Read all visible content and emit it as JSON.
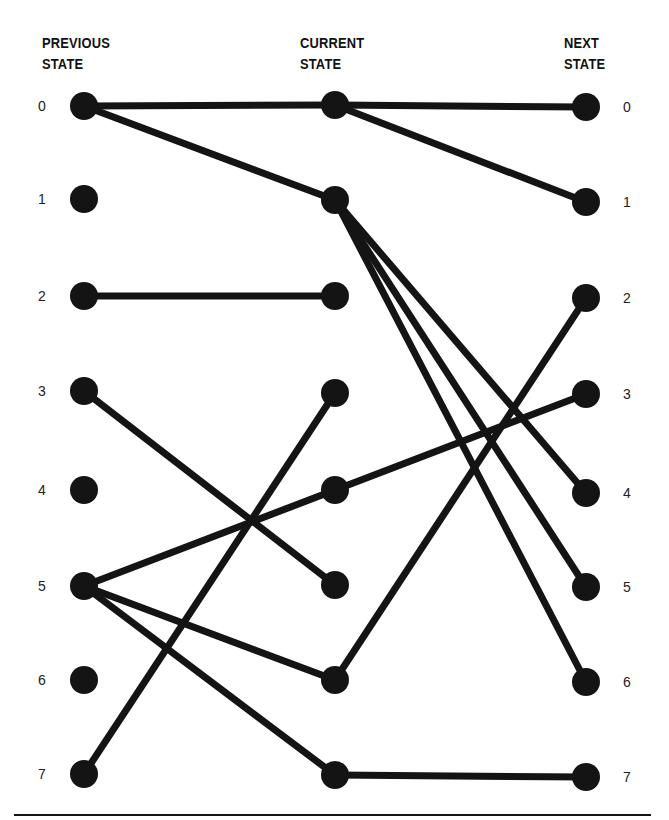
{
  "headers": {
    "previous": {
      "line1": "PREVIOUS",
      "line2": "STATE"
    },
    "current": {
      "line1": "CURRENT",
      "line2": "STATE"
    },
    "next": {
      "line1": "NEXT",
      "line2": "STATE"
    }
  },
  "states": [
    "0",
    "1",
    "2",
    "3",
    "4",
    "5",
    "6",
    "7"
  ],
  "columns": {
    "previous": {
      "x": 84,
      "ys": [
        106,
        199,
        296,
        391,
        490,
        586,
        680,
        774
      ]
    },
    "current": {
      "x": 335,
      "ys": [
        105,
        200,
        296,
        393,
        490,
        585,
        680,
        775
      ]
    },
    "next": {
      "x": 586,
      "ys": [
        107,
        202,
        298,
        394,
        493,
        587,
        682,
        777
      ]
    }
  },
  "edges": {
    "previous_to_current": [
      [
        0,
        0
      ],
      [
        0,
        1
      ],
      [
        2,
        2
      ],
      [
        3,
        5
      ],
      [
        5,
        4
      ],
      [
        5,
        6
      ],
      [
        5,
        7
      ],
      [
        7,
        3
      ]
    ],
    "current_to_next": [
      [
        0,
        0
      ],
      [
        0,
        1
      ],
      [
        1,
        4
      ],
      [
        1,
        5
      ],
      [
        1,
        6
      ],
      [
        4,
        3
      ],
      [
        6,
        2
      ],
      [
        7,
        7
      ]
    ]
  },
  "style": {
    "ink": "#141414",
    "node_radius": 14,
    "edge_width": 7
  }
}
